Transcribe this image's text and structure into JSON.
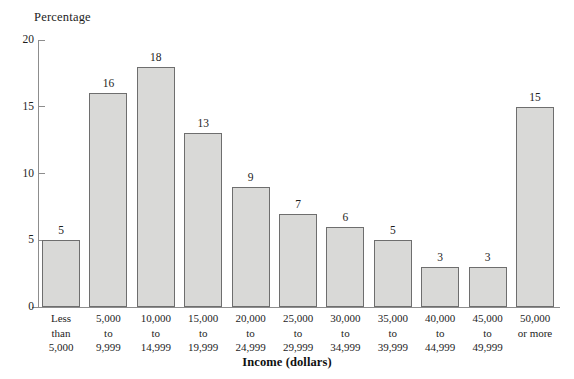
{
  "chart_data": {
    "type": "bar",
    "title": "",
    "xlabel": "Income (dollars)",
    "ylabel": "Percentage",
    "ylim": [
      0,
      20
    ],
    "yticks": [
      0,
      5,
      10,
      15,
      20
    ],
    "grid": false,
    "legend": null,
    "categories": [
      "Less than 5,000",
      "5,000 to 9,999",
      "10,000 to 14,999",
      "15,000 to 19,999",
      "20,000 to 24,999",
      "25,000 to 29,999",
      "30,000 to 34,999",
      "35,000 to 39,999",
      "40,000 to 44,999",
      "45,000 to 49,999",
      "50,000 or more"
    ],
    "category_lines": [
      [
        "Less",
        "than",
        "5,000"
      ],
      [
        "5,000",
        "to",
        "9,999"
      ],
      [
        "10,000",
        "to",
        "14,999"
      ],
      [
        "15,000",
        "to",
        "19,999"
      ],
      [
        "20,000",
        "to",
        "24,999"
      ],
      [
        "25,000",
        "to",
        "29,999"
      ],
      [
        "30,000",
        "to",
        "34,999"
      ],
      [
        "35,000",
        "to",
        "39,999"
      ],
      [
        "40,000",
        "to",
        "44,999"
      ],
      [
        "45,000",
        "to",
        "49,999"
      ],
      [
        "50,000",
        "or more",
        ""
      ]
    ],
    "values": [
      5,
      16,
      18,
      13,
      9,
      7,
      6,
      5,
      3,
      3,
      15
    ],
    "value_labels": [
      "5",
      "16",
      "18",
      "13",
      "9",
      "7",
      "6",
      "5",
      "3",
      "3",
      "15"
    ],
    "bar_fill_color": "#d9d9d7",
    "bar_border_color": "#6e6e6e",
    "axis_color": "#8d8d8d",
    "text_color": "#1d1d1d",
    "background_color": "#ffffff"
  }
}
